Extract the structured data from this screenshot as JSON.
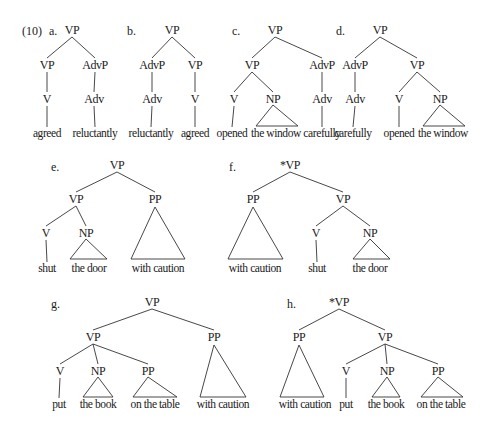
{
  "example_number": "(10)",
  "trees": [
    {
      "id": "a",
      "label": "a.",
      "label_pos": [
        49,
        35
      ],
      "grammatical": true,
      "nodes": [
        {
          "id": "n0",
          "text": "VP",
          "x": 72,
          "y": 34,
          "type": "cat"
        },
        {
          "id": "n1",
          "text": "VP",
          "x": 47,
          "y": 69,
          "type": "cat"
        },
        {
          "id": "n2",
          "text": "AdvP",
          "x": 95,
          "y": 69,
          "type": "cat"
        },
        {
          "id": "n3",
          "text": "V",
          "x": 47,
          "y": 103,
          "type": "cat"
        },
        {
          "id": "n4",
          "text": "Adv",
          "x": 94,
          "y": 103,
          "type": "cat"
        },
        {
          "id": "n5",
          "text": "agreed",
          "x": 47,
          "y": 137,
          "type": "word"
        },
        {
          "id": "n6",
          "text": "reluctantly",
          "x": 95,
          "y": 137,
          "type": "word"
        }
      ],
      "edges": [
        [
          "n0",
          "n1"
        ],
        [
          "n0",
          "n2"
        ],
        [
          "n1",
          "n3"
        ],
        [
          "n2",
          "n4"
        ],
        [
          "n3",
          "n5"
        ],
        [
          "n4",
          "n6"
        ]
      ],
      "triangles": []
    },
    {
      "id": "b",
      "label": "b.",
      "label_pos": [
        127,
        35
      ],
      "grammatical": true,
      "nodes": [
        {
          "id": "n0",
          "text": "VP",
          "x": 172,
          "y": 34,
          "type": "cat"
        },
        {
          "id": "n1",
          "text": "AdvP",
          "x": 152,
          "y": 69,
          "type": "cat"
        },
        {
          "id": "n2",
          "text": "VP",
          "x": 195,
          "y": 69,
          "type": "cat"
        },
        {
          "id": "n3",
          "text": "Adv",
          "x": 152,
          "y": 103,
          "type": "cat"
        },
        {
          "id": "n4",
          "text": "V",
          "x": 195,
          "y": 103,
          "type": "cat"
        },
        {
          "id": "n5",
          "text": "reluctantly",
          "x": 151,
          "y": 137,
          "type": "word"
        },
        {
          "id": "n6",
          "text": "agreed",
          "x": 195,
          "y": 137,
          "type": "word"
        }
      ],
      "edges": [
        [
          "n0",
          "n1"
        ],
        [
          "n0",
          "n2"
        ],
        [
          "n1",
          "n3"
        ],
        [
          "n2",
          "n4"
        ],
        [
          "n3",
          "n5"
        ],
        [
          "n4",
          "n6"
        ]
      ],
      "triangles": []
    },
    {
      "id": "c",
      "label": "c.",
      "label_pos": [
        232,
        35
      ],
      "grammatical": true,
      "nodes": [
        {
          "id": "n0",
          "text": "VP",
          "x": 275,
          "y": 34,
          "type": "cat"
        },
        {
          "id": "n1",
          "text": "VP",
          "x": 252,
          "y": 69,
          "type": "cat"
        },
        {
          "id": "n2",
          "text": "AdvP",
          "x": 322,
          "y": 69,
          "type": "cat"
        },
        {
          "id": "n3",
          "text": "V",
          "x": 234,
          "y": 103,
          "type": "cat"
        },
        {
          "id": "n4",
          "text": "NP",
          "x": 273,
          "y": 103,
          "type": "cat"
        },
        {
          "id": "n5",
          "text": "Adv",
          "x": 322,
          "y": 103,
          "type": "cat"
        },
        {
          "id": "n6",
          "text": "opened",
          "x": 232,
          "y": 137,
          "type": "word"
        },
        {
          "id": "n7",
          "text": "the window",
          "x": 276,
          "y": 137,
          "type": "word"
        },
        {
          "id": "n8",
          "text": "carefully",
          "x": 322,
          "y": 137,
          "type": "word"
        }
      ],
      "edges": [
        [
          "n0",
          "n1"
        ],
        [
          "n0",
          "n2"
        ],
        [
          "n1",
          "n3"
        ],
        [
          "n1",
          "n4"
        ],
        [
          "n2",
          "n5"
        ],
        [
          "n3",
          "n6"
        ],
        [
          "n5",
          "n8"
        ]
      ],
      "triangles": [
        {
          "apex": [
            273,
            105
          ],
          "left": [
            256,
            126
          ],
          "right": [
            298,
            126
          ]
        }
      ]
    },
    {
      "id": "d",
      "label": "d.",
      "label_pos": [
        336,
        35
      ],
      "grammatical": true,
      "nodes": [
        {
          "id": "n0",
          "text": "VP",
          "x": 380,
          "y": 34,
          "type": "cat"
        },
        {
          "id": "n1",
          "text": "AdvP",
          "x": 355,
          "y": 69,
          "type": "cat"
        },
        {
          "id": "n2",
          "text": "VP",
          "x": 417,
          "y": 69,
          "type": "cat"
        },
        {
          "id": "n3",
          "text": "Adv",
          "x": 355,
          "y": 103,
          "type": "cat"
        },
        {
          "id": "n4",
          "text": "V",
          "x": 399,
          "y": 103,
          "type": "cat"
        },
        {
          "id": "n5",
          "text": "NP",
          "x": 440,
          "y": 103,
          "type": "cat"
        },
        {
          "id": "n6",
          "text": "carefully",
          "x": 353,
          "y": 137,
          "type": "word"
        },
        {
          "id": "n7",
          "text": "opened",
          "x": 399,
          "y": 137,
          "type": "word"
        },
        {
          "id": "n8",
          "text": "the window",
          "x": 443,
          "y": 137,
          "type": "word"
        }
      ],
      "edges": [
        [
          "n0",
          "n1"
        ],
        [
          "n0",
          "n2"
        ],
        [
          "n1",
          "n3"
        ],
        [
          "n2",
          "n4"
        ],
        [
          "n2",
          "n5"
        ],
        [
          "n3",
          "n6"
        ],
        [
          "n4",
          "n7"
        ]
      ],
      "triangles": [
        {
          "apex": [
            440,
            105
          ],
          "left": [
            423,
            126
          ],
          "right": [
            465,
            126
          ]
        }
      ]
    },
    {
      "id": "e",
      "label": "e.",
      "label_pos": [
        51,
        171
      ],
      "grammatical": true,
      "nodes": [
        {
          "id": "n0",
          "text": "VP",
          "x": 117,
          "y": 169,
          "type": "cat"
        },
        {
          "id": "n1",
          "text": "VP",
          "x": 76,
          "y": 203,
          "type": "cat"
        },
        {
          "id": "n2",
          "text": "PP",
          "x": 155,
          "y": 203,
          "type": "cat"
        },
        {
          "id": "n3",
          "text": "V",
          "x": 46,
          "y": 237,
          "type": "cat"
        },
        {
          "id": "n4",
          "text": "NP",
          "x": 86,
          "y": 237,
          "type": "cat"
        },
        {
          "id": "n5",
          "text": "shut",
          "x": 47,
          "y": 272,
          "type": "word"
        },
        {
          "id": "n6",
          "text": "the door",
          "x": 89,
          "y": 272,
          "type": "word"
        },
        {
          "id": "n7",
          "text": "with caution",
          "x": 158,
          "y": 272,
          "type": "word"
        }
      ],
      "edges": [
        [
          "n0",
          "n1"
        ],
        [
          "n0",
          "n2"
        ],
        [
          "n1",
          "n3"
        ],
        [
          "n1",
          "n4"
        ],
        [
          "n3",
          "n5"
        ]
      ],
      "triangles": [
        {
          "apex": [
            86,
            239
          ],
          "left": [
            70,
            259
          ],
          "right": [
            107,
            259
          ]
        },
        {
          "apex": [
            155,
            207
          ],
          "left": [
            131,
            259
          ],
          "right": [
            185,
            259
          ]
        }
      ]
    },
    {
      "id": "f",
      "label": "f.",
      "label_pos": [
        229,
        171
      ],
      "grammatical": false,
      "nodes": [
        {
          "id": "n0",
          "text": "*VP",
          "x": 290,
          "y": 169,
          "type": "cat"
        },
        {
          "id": "n1",
          "text": "PP",
          "x": 253,
          "y": 203,
          "type": "cat"
        },
        {
          "id": "n2",
          "text": "VP",
          "x": 343,
          "y": 203,
          "type": "cat"
        },
        {
          "id": "n3",
          "text": "V",
          "x": 316,
          "y": 237,
          "type": "cat"
        },
        {
          "id": "n4",
          "text": "NP",
          "x": 370,
          "y": 237,
          "type": "cat"
        },
        {
          "id": "n5",
          "text": "with caution",
          "x": 255,
          "y": 272,
          "type": "word"
        },
        {
          "id": "n6",
          "text": "shut",
          "x": 317,
          "y": 272,
          "type": "word"
        },
        {
          "id": "n7",
          "text": "the door",
          "x": 370,
          "y": 272,
          "type": "word"
        }
      ],
      "edges": [
        [
          "n0",
          "n1"
        ],
        [
          "n0",
          "n2"
        ],
        [
          "n2",
          "n3"
        ],
        [
          "n2",
          "n4"
        ],
        [
          "n3",
          "n6"
        ]
      ],
      "triangles": [
        {
          "apex": [
            253,
            207
          ],
          "left": [
            228,
            259
          ],
          "right": [
            283,
            259
          ]
        },
        {
          "apex": [
            370,
            239
          ],
          "left": [
            353,
            259
          ],
          "right": [
            390,
            259
          ]
        }
      ]
    },
    {
      "id": "g",
      "label": "g.",
      "label_pos": [
        51,
        308
      ],
      "grammatical": true,
      "nodes": [
        {
          "id": "n0",
          "text": "VP",
          "x": 152,
          "y": 306,
          "type": "cat"
        },
        {
          "id": "n1",
          "text": "VP",
          "x": 93,
          "y": 341,
          "type": "cat"
        },
        {
          "id": "n2",
          "text": "PP",
          "x": 214,
          "y": 341,
          "type": "cat"
        },
        {
          "id": "n3",
          "text": "V",
          "x": 60,
          "y": 375,
          "type": "cat"
        },
        {
          "id": "n4",
          "text": "NP",
          "x": 98,
          "y": 375,
          "type": "cat"
        },
        {
          "id": "n5",
          "text": "PP",
          "x": 148,
          "y": 375,
          "type": "cat"
        },
        {
          "id": "n6",
          "text": "put",
          "x": 59,
          "y": 408,
          "type": "word"
        },
        {
          "id": "n7",
          "text": "the book",
          "x": 98,
          "y": 408,
          "type": "word"
        },
        {
          "id": "n8",
          "text": "on the table",
          "x": 155,
          "y": 408,
          "type": "word"
        },
        {
          "id": "n9",
          "text": "with caution",
          "x": 223,
          "y": 408,
          "type": "word"
        }
      ],
      "edges": [
        [
          "n0",
          "n1"
        ],
        [
          "n0",
          "n2"
        ],
        [
          "n1",
          "n3"
        ],
        [
          "n1",
          "n4"
        ],
        [
          "n1",
          "n5"
        ],
        [
          "n3",
          "n6"
        ]
      ],
      "triangles": [
        {
          "apex": [
            98,
            377
          ],
          "left": [
            83,
            397
          ],
          "right": [
            113,
            397
          ]
        },
        {
          "apex": [
            148,
            377
          ],
          "left": [
            133,
            397
          ],
          "right": [
            177,
            397
          ]
        },
        {
          "apex": [
            214,
            345
          ],
          "left": [
            200,
            397
          ],
          "right": [
            246,
            397
          ]
        }
      ]
    },
    {
      "id": "h",
      "label": "h.",
      "label_pos": [
        287,
        308
      ],
      "grammatical": false,
      "nodes": [
        {
          "id": "n0",
          "text": "*VP",
          "x": 339,
          "y": 306,
          "type": "cat"
        },
        {
          "id": "n1",
          "text": "PP",
          "x": 299,
          "y": 341,
          "type": "cat"
        },
        {
          "id": "n2",
          "text": "VP",
          "x": 385,
          "y": 341,
          "type": "cat"
        },
        {
          "id": "n3",
          "text": "V",
          "x": 346,
          "y": 375,
          "type": "cat"
        },
        {
          "id": "n4",
          "text": "NP",
          "x": 387,
          "y": 375,
          "type": "cat"
        },
        {
          "id": "n5",
          "text": "PP",
          "x": 438,
          "y": 375,
          "type": "cat"
        },
        {
          "id": "n6",
          "text": "with caution",
          "x": 305,
          "y": 408,
          "type": "word"
        },
        {
          "id": "n7",
          "text": "put",
          "x": 346,
          "y": 408,
          "type": "word"
        },
        {
          "id": "n8",
          "text": "the book",
          "x": 386,
          "y": 408,
          "type": "word"
        },
        {
          "id": "n9",
          "text": "on the table",
          "x": 441,
          "y": 408,
          "type": "word"
        }
      ],
      "edges": [
        [
          "n0",
          "n1"
        ],
        [
          "n0",
          "n2"
        ],
        [
          "n2",
          "n3"
        ],
        [
          "n2",
          "n4"
        ],
        [
          "n2",
          "n5"
        ],
        [
          "n3",
          "n7"
        ]
      ],
      "triangles": [
        {
          "apex": [
            299,
            345
          ],
          "left": [
            280,
            397
          ],
          "right": [
            324,
            397
          ]
        },
        {
          "apex": [
            387,
            377
          ],
          "left": [
            372,
            397
          ],
          "right": [
            400,
            397
          ]
        },
        {
          "apex": [
            438,
            377
          ],
          "left": [
            421,
            397
          ],
          "right": [
            463,
            397
          ]
        }
      ]
    }
  ]
}
